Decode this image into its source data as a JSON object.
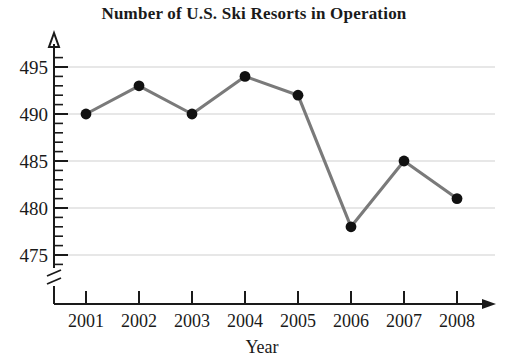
{
  "chart_data": {
    "type": "line",
    "title": "Number of U.S. Ski Resorts in Operation",
    "xlabel": "Year",
    "ylabel": "",
    "categories": [
      "2001",
      "2002",
      "2003",
      "2004",
      "2005",
      "2006",
      "2007",
      "2008"
    ],
    "values": [
      490,
      493,
      490,
      494,
      492,
      478,
      485,
      481
    ],
    "series": [
      {
        "name": "U.S. Ski Resorts in Operation",
        "values": [
          490,
          493,
          490,
          494,
          492,
          478,
          485,
          481
        ]
      }
    ],
    "ylim": [
      474,
      496
    ],
    "ytick_labels": [
      "475",
      "480",
      "485",
      "490",
      "495"
    ],
    "ytick_values": [
      475,
      480,
      485,
      490,
      495
    ],
    "yminor_step": 1,
    "xtick_labels": [
      "2001",
      "2002",
      "2003",
      "2004",
      "2005",
      "2006",
      "2007",
      "2008"
    ],
    "grid": "horizontal",
    "legend": "none",
    "axis_break": "y-axis below 475",
    "line_color": "#7a7a7a",
    "marker_color": "#111111",
    "grid_color": "#cfcfcf",
    "axis_color": "#1a1a1a"
  }
}
